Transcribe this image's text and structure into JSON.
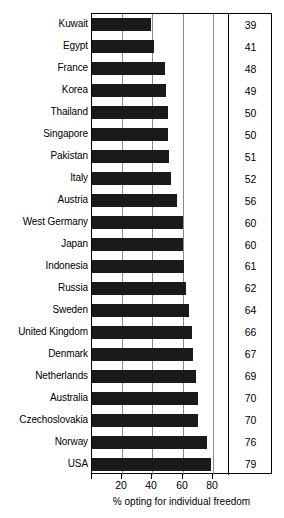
{
  "chart_data": {
    "type": "bar",
    "orientation": "horizontal",
    "title": "",
    "xlabel": "% opting for individual freedom",
    "ylabel": "",
    "xlim": [
      0,
      90
    ],
    "xticks": [
      20,
      40,
      60,
      80
    ],
    "xticklabels": [
      "20",
      "40",
      "60",
      "80"
    ],
    "grid": true,
    "gridlines_at": [
      20,
      40,
      60,
      80
    ],
    "legend": null,
    "value_column_shown": true,
    "categories": [
      "Kuwait",
      "Egypt",
      "France",
      "Korea",
      "Thailand",
      "Singapore",
      "Pakistan",
      "Italy",
      "Austria",
      "West Germany",
      "Japan",
      "Indonesia",
      "Russia",
      "Sweden",
      "United Kingdom",
      "Denmark",
      "Netherlands",
      "Australia",
      "Czechoslovakia",
      "Norway",
      "USA"
    ],
    "values": [
      39,
      41,
      48,
      49,
      50,
      50,
      51,
      52,
      56,
      60,
      60,
      61,
      62,
      64,
      66,
      67,
      69,
      70,
      70,
      76,
      79
    ],
    "value_labels": [
      "39",
      "41",
      "48",
      "49",
      "50",
      "50",
      "51",
      "52",
      "56",
      "60",
      "60",
      "61",
      "62",
      "64",
      "66",
      "67",
      "69",
      "70",
      "70",
      "76",
      "79"
    ],
    "colors": {
      "bar": "#1a1a1a",
      "grid": "#8a8a8a",
      "frame": "#000000",
      "background": "#ffffff",
      "text": "#000000"
    }
  }
}
